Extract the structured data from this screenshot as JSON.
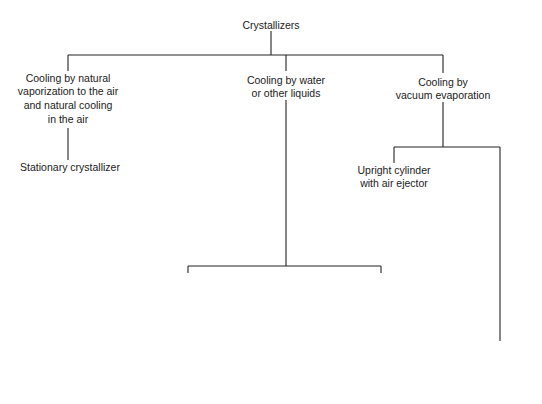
{
  "diagram": {
    "type": "tree",
    "root": {
      "lines": [
        "Crystallizers"
      ]
    },
    "nodes": {
      "natural": {
        "lines": [
          "Cooling by natural",
          "vaporization to the air",
          "and natural cooling",
          "in the air"
        ]
      },
      "stationary": {
        "lines": [
          "Stationary crystallizer"
        ]
      },
      "water": {
        "lines": [
          "Cooling by water",
          "or other liquids"
        ]
      },
      "coils": {
        "lines": [
          "Cooling coils",
          "with agitation"
        ]
      },
      "rotating": {
        "lines": [
          "Rotating",
          "cooling coil"
        ]
      },
      "jacket": {
        "lines": [
          "Cooling",
          "in jacket"
        ]
      },
      "horizontal": {
        "lines": [
          "Horizontal cylinders",
          "with agitation"
        ]
      },
      "troughs": {
        "lines": [
          "Jacketed troughs with",
          "long-pitch agitators"
        ]
      },
      "pan": {
        "lines": [
          "Jacketed pan",
          "with scraper"
        ]
      },
      "atmospheric": {
        "lines": [
          "Atmospheric"
        ]
      },
      "vacuum_app": {
        "lines": [
          "With vacuum",
          "application"
        ]
      },
      "vacuum_evap": {
        "lines": [
          "Cooling by",
          "vacuum evaporation"
        ]
      },
      "upright": {
        "lines": [
          "Upright cylinder",
          "with air ejector"
        ]
      }
    },
    "edges": [
      [
        "Crystallizers",
        "Cooling by natural vaporization to the air and natural cooling in the air"
      ],
      [
        "Crystallizers",
        "Cooling by water or other liquids"
      ],
      [
        "Crystallizers",
        "Cooling by vacuum evaporation"
      ],
      [
        "Cooling by natural vaporization to the air and natural cooling in the air",
        "Stationary crystallizer"
      ],
      [
        "Cooling by water or other liquids",
        "Cooling coils with agitation"
      ],
      [
        "Cooling by water or other liquids",
        "Rotating cooling coil"
      ],
      [
        "Cooling by water or other liquids",
        "Cooling in jacket"
      ],
      [
        "Cooling in jacket",
        "Horizontal cylinders with agitation"
      ],
      [
        "Cooling in jacket",
        "Jacketed pan with scraper"
      ],
      [
        "Horizontal cylinders with agitation",
        "Jacketed troughs with long-pitch agitators"
      ],
      [
        "Jacketed pan with scraper",
        "Atmospheric"
      ],
      [
        "Jacketed pan with scraper",
        "With vacuum application"
      ],
      [
        "Cooling by vacuum evaporation",
        "Upright cylinder with air ejector"
      ],
      [
        "Cooling by vacuum evaporation",
        "With vacuum application"
      ]
    ]
  }
}
